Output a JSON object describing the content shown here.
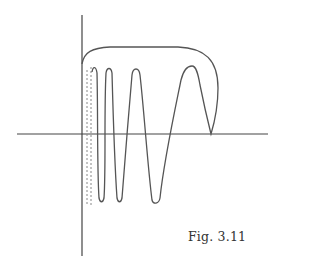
{
  "figure": {
    "caption": "Fig. 3.11",
    "line_color": "#555555",
    "axis_color": "#444444",
    "dash_color": "#888888"
  }
}
